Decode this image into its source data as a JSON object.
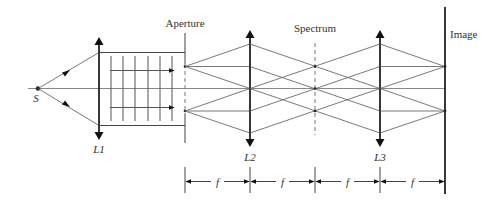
{
  "diagram": {
    "type": "4f optical spatial-filtering system",
    "labels": {
      "source": "S",
      "lens1": "L1",
      "lens2": "L2",
      "lens3": "L3",
      "aperture": "Aperture",
      "spectrum": "Spectrum",
      "image": "Image"
    },
    "dimensions": [
      "f",
      "f",
      "f",
      "f"
    ]
  }
}
